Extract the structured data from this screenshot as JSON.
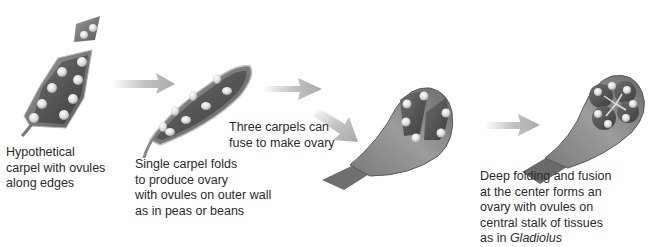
{
  "diagram": {
    "stages": [
      {
        "id": "hypothetical-carpel",
        "caption_lines": [
          "Hypothetical",
          "carpel with ovules",
          "along edges"
        ]
      },
      {
        "id": "single-carpel",
        "caption_lines": [
          "Single carpel folds",
          "to produce ovary",
          "with ovules on outer wall",
          "as in peas or beans"
        ]
      },
      {
        "id": "three-carpels",
        "caption_lines": [
          "Three carpels can",
          "fuse to make ovary"
        ]
      },
      {
        "id": "central-stalk",
        "caption_lines": [
          "Deep folding and fusion",
          "at the center forms an",
          "ovary with ovules on",
          "central stalk of tissues"
        ],
        "caption_last_prefix": "as in ",
        "caption_last_italic": "Gladiolus"
      }
    ],
    "arrows": 4,
    "colors": {
      "tissue_dark": "#5e5e5e",
      "tissue_mid": "#8a8a8a",
      "tissue_light": "#b5b5b5",
      "ovule": "#e8e8e8",
      "arrow": "#bdbdbd"
    }
  }
}
